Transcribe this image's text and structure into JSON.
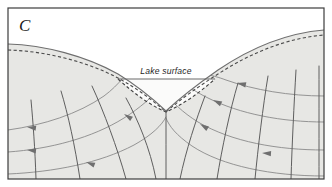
{
  "figure": {
    "panel_label": "C",
    "lake_surface_label": "Lake surface",
    "caption_hidden": "",
    "colors": {
      "background": "#ffffff",
      "border": "#3c3c3c",
      "subsurface_fill": "#e7e7e4",
      "lake_fill": "#fbfbfa",
      "land_surface_line": "#6e6e6e",
      "water_table_line": "#4a4a4a",
      "lake_surface_line": "#6b6b6b",
      "equipotential_line": "#5e5e5e",
      "flowline": "#8a8a8a",
      "arrow": "#6f6f6f",
      "label_text": "#1f1f1f"
    },
    "geometry": {
      "panel_x": 8,
      "panel_y": 8,
      "panel_width": 316,
      "panel_height": 171,
      "lake_surface_y": 79,
      "left_land_edge_y": 44,
      "right_land_edge_y": 30,
      "basin_bottom_y": 112,
      "divide_x": 166
    }
  },
  "land_surface_path": "M 8 44 C 44 45 86 56 118 74 C 136 85 150 96 166 111 C 182 96 198 84 218 70 C 252 47 288 33 324 30",
  "water_table_path": "M 8 50 C 44 51 86 61 118 78 C 136 88 150 98 166 112 C 182 98 198 87 218 74 C 252 52 288 38 324 35",
  "lake_surface_path": "M 118 79 L 215 79",
  "basin_floor_path": "M 118 79 C 136 95 150 105 166 112 C 182 105 198 94 215 79",
  "equipotential_lines": [
    {
      "id": "eq-left-4",
      "path": "M 31 100 C 33 122 35 148 36 179"
    },
    {
      "id": "eq-left-3",
      "path": "M 61 91 C 68 114 75 146 80 179"
    },
    {
      "id": "eq-left-2",
      "path": "M 92 86 C 104 112 117 147 126 179"
    },
    {
      "id": "eq-left-1",
      "path": "M 126 98 C 138 120 150 148 156 179"
    },
    {
      "id": "eq-divide",
      "path": "M 166 112 C 166 133 166 156 166 179"
    },
    {
      "id": "eq-right-1",
      "path": "M 205 96 C 196 120 186 150 180 179"
    },
    {
      "id": "eq-right-2",
      "path": "M 238 83 C 230 110 222 148 217 179"
    },
    {
      "id": "eq-right-3",
      "path": "M 268 76 C 263 106 258 148 255 179"
    },
    {
      "id": "eq-right-4",
      "path": "M 296 70 C 294 104 292 146 291 179"
    },
    {
      "id": "eq-right-5",
      "path": "M 319 66 C 319 102 319 146 319 179"
    }
  ],
  "flow_lines": [
    {
      "id": "flow-left-1",
      "path": "M 8 130 C 44 125 78 114 104 96 C 112 90 118 84 122 79"
    },
    {
      "id": "flow-left-2",
      "path": "M 8 152 C 50 149 92 138 124 118 C 140 108 152 97 160 88"
    },
    {
      "id": "flow-left-3",
      "path": "M 8 174 C 54 172 100 163 134 145 C 152 135 162 125 166 117"
    },
    {
      "id": "flow-right-1",
      "path": "M 324 96 C 290 96 254 90 226 80 C 218 77 213 76 210 75"
    },
    {
      "id": "flow-right-2",
      "path": "M 324 122 C 282 122 240 114 208 98 C 194 91 184 84 178 78"
    },
    {
      "id": "flow-right-3",
      "path": "M 324 150 C 278 150 232 142 198 122 C 182 112 172 102 167 94"
    },
    {
      "id": "flow-right-4",
      "path": "M 324 176 C 272 176 222 166 192 146 C 176 135 169 126 166 118"
    }
  ],
  "flow_arrows": [
    {
      "id": "arrow-left-1",
      "x": 27,
      "y": 127,
      "angle": 188
    },
    {
      "id": "arrow-left-2",
      "x": 27,
      "y": 150,
      "angle": 186
    },
    {
      "id": "arrow-left-3",
      "x": 86,
      "y": 162,
      "angle": 200
    },
    {
      "id": "arrow-left-4",
      "x": 124,
      "y": 114,
      "angle": 213
    },
    {
      "id": "arrow-right-1",
      "x": 237,
      "y": 83,
      "angle": 192
    },
    {
      "id": "arrow-right-2",
      "x": 213,
      "y": 100,
      "angle": 206
    },
    {
      "id": "arrow-right-3",
      "x": 200,
      "y": 124,
      "angle": 212
    },
    {
      "id": "arrow-right-4",
      "x": 262,
      "y": 153,
      "angle": 184
    }
  ]
}
